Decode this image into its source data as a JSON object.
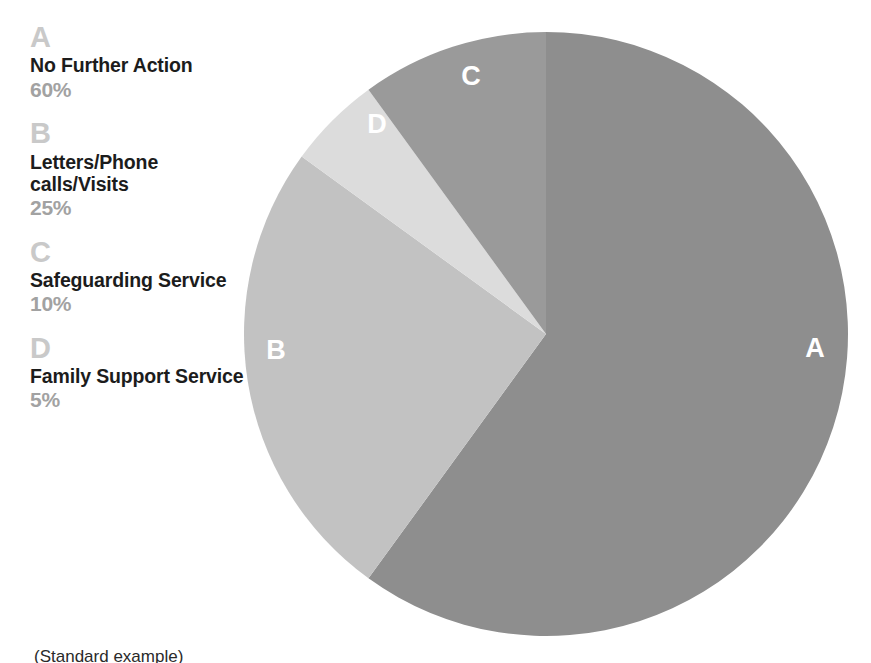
{
  "legend": {
    "entries": [
      {
        "letter": "A",
        "label": "No Further Action",
        "percent": "60%"
      },
      {
        "letter": "B",
        "label": "Letters/Phone calls/Visits",
        "percent": "25%"
      },
      {
        "letter": "C",
        "label": "Safeguarding Service",
        "percent": "10%"
      },
      {
        "letter": "D",
        "label": "Family Support Service",
        "percent": "5%"
      }
    ]
  },
  "pie": {
    "labels": {
      "a": "A",
      "b": "B",
      "c": "C",
      "d": "D"
    }
  },
  "caption": {
    "text": "(Standard example)"
  },
  "colors": {
    "slice_a": "#8e8e8e",
    "slice_b": "#c2c2c2",
    "slice_c": "#9a9a9a",
    "slice_d": "#dcdcdc",
    "legend_letter": "#c9c9c9",
    "legend_label": "#1c1c1c",
    "legend_percent": "#a2a2a2",
    "slice_label": "#ffffff",
    "background": "#ffffff"
  },
  "chart_data": {
    "type": "pie",
    "title": "",
    "subtitle": "",
    "xlabel": "",
    "ylabel": "",
    "grid": false,
    "legend_position": "left",
    "start_angle_deg": 0,
    "direction": "clockwise",
    "center_px": [
      546,
      334
    ],
    "radius_px": 302,
    "units": "percent",
    "total": 100,
    "categories": [
      "No Further Action",
      "Letters/Phone calls/Visits",
      "Safeguarding Service",
      "Family Support Service"
    ],
    "keys": [
      "A",
      "B",
      "C",
      "D"
    ],
    "values": [
      60,
      25,
      10,
      5
    ],
    "slices": [
      {
        "key": "A",
        "label": "No Further Action",
        "value": 60,
        "display": "60%",
        "color": "#8e8e8e",
        "start_deg": 0,
        "end_deg": 216,
        "label_pos_px": [
          815,
          350
        ]
      },
      {
        "key": "B",
        "label": "Letters/Phone calls/Visits",
        "value": 25,
        "display": "25%",
        "color": "#c2c2c2",
        "start_deg": 216,
        "end_deg": 306,
        "label_pos_px": [
          276,
          352
        ]
      },
      {
        "key": "D",
        "label": "Family Support Service",
        "value": 5,
        "display": "5%",
        "color": "#dcdcdc",
        "start_deg": 306,
        "end_deg": 324,
        "label_pos_px": [
          377,
          126
        ]
      },
      {
        "key": "C",
        "label": "Safeguarding Service",
        "value": 10,
        "display": "10%",
        "color": "#9a9a9a",
        "start_deg": 324,
        "end_deg": 360,
        "label_pos_px": [
          471,
          78
        ]
      }
    ]
  }
}
